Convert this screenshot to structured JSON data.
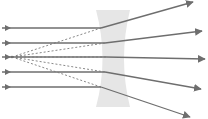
{
  "diagram": {
    "type": "diverging-lens-ray-diagram",
    "colors": {
      "background": "#ffffff",
      "lens": "#e6e6e6",
      "ray": "#6e6e6e",
      "virtual_ray": "#7a7a7a"
    },
    "lens": {
      "shape": "concave",
      "outer_left": 96,
      "outer_right": 130,
      "waist_left": 105,
      "waist_right": 122,
      "top": 10,
      "bottom": 107
    },
    "focal_point": {
      "x": 12,
      "y": 57
    },
    "rays": [
      {
        "in_y": 28,
        "hit": [
          101,
          28
        ],
        "end": [
          193,
          2
        ]
      },
      {
        "in_y": 43,
        "hit": [
          105,
          43
        ],
        "end": [
          202,
          31
        ]
      },
      {
        "in_y": 57,
        "hit": [
          106,
          57
        ],
        "end": [
          205,
          59
        ]
      },
      {
        "in_y": 72,
        "hit": [
          105,
          72
        ],
        "end": [
          201,
          89
        ]
      },
      {
        "in_y": 87,
        "hit": [
          101,
          87
        ],
        "end": [
          190,
          117
        ]
      }
    ],
    "incoming_start_x": 2
  }
}
